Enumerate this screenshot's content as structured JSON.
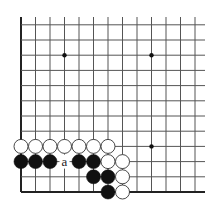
{
  "diagram": {
    "type": "go-board-fragment",
    "corner": "lower-left",
    "colors": {
      "line": "#555555",
      "edge": "#222222",
      "black_stone": "#111111",
      "white_stone": "#ffffff",
      "white_outline": "#333333",
      "star": "#111111"
    },
    "grid": {
      "x0": 21,
      "dx": 14.5,
      "cols": 13,
      "y_bottom": 192,
      "dy": 15.2,
      "rows": 12,
      "open_right_to": 205,
      "open_top_to": 17
    },
    "star_points": [
      {
        "col": 4,
        "row": 4
      },
      {
        "col": 4,
        "row": 10
      },
      {
        "col": 10,
        "row": 4
      },
      {
        "col": 10,
        "row": 10
      }
    ],
    "stones": [
      {
        "color": "white",
        "col": 1,
        "row": 4
      },
      {
        "color": "white",
        "col": 2,
        "row": 4
      },
      {
        "color": "white",
        "col": 3,
        "row": 4
      },
      {
        "color": "white",
        "col": 4,
        "row": 4
      },
      {
        "color": "white",
        "col": 5,
        "row": 4
      },
      {
        "color": "white",
        "col": 6,
        "row": 4
      },
      {
        "color": "white",
        "col": 7,
        "row": 4
      },
      {
        "color": "black",
        "col": 1,
        "row": 3
      },
      {
        "color": "black",
        "col": 2,
        "row": 3
      },
      {
        "color": "black",
        "col": 3,
        "row": 3
      },
      {
        "color": "black",
        "col": 5,
        "row": 3
      },
      {
        "color": "black",
        "col": 6,
        "row": 3
      },
      {
        "color": "white",
        "col": 7,
        "row": 3
      },
      {
        "color": "white",
        "col": 8,
        "row": 3
      },
      {
        "color": "black",
        "col": 6,
        "row": 2
      },
      {
        "color": "black",
        "col": 7,
        "row": 2
      },
      {
        "color": "white",
        "col": 8,
        "row": 2
      },
      {
        "color": "black",
        "col": 7,
        "row": 1
      },
      {
        "color": "white",
        "col": 8,
        "row": 1
      }
    ],
    "labels": [
      {
        "text": "a",
        "col": 4,
        "row": 3
      }
    ]
  }
}
